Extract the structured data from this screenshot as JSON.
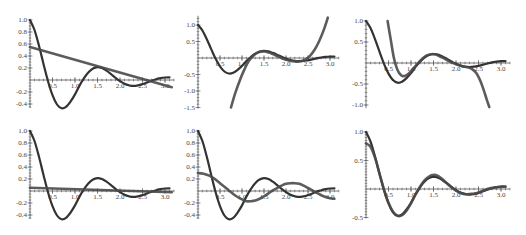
{
  "chart_data": [
    {
      "type": "line",
      "panel": 1,
      "frame": {
        "ox": 30,
        "oy": 80,
        "sx": 45,
        "sy": 60
      },
      "xlim": [
        0,
        3.2
      ],
      "ylim": [
        -0.45,
        1.0
      ],
      "xticks": [
        {
          "v": 0.5,
          "label": "0.5"
        },
        {
          "v": 1.0,
          "label": "1.0"
        },
        {
          "v": 1.5,
          "label": "1.5"
        },
        {
          "v": 2.0,
          "label": "2.0"
        },
        {
          "v": 2.5,
          "label": "2.5"
        },
        {
          "v": 3.0,
          "label": "3.0"
        }
      ],
      "yticks": [
        {
          "v": 1.0,
          "label": "1.0"
        },
        {
          "v": 0.8,
          "label": "0.8"
        },
        {
          "v": 0.6,
          "label": "0.6"
        },
        {
          "v": 0.4,
          "label": "0.4"
        },
        {
          "v": 0.2,
          "label": "0.2"
        },
        {
          "v": -0.2,
          "label": "-0.2"
        },
        {
          "v": -0.4,
          "label": "-0.4"
        }
      ],
      "series": [
        {
          "name": "f",
          "role": "curve",
          "x_start": 0,
          "x_step": 0.1,
          "values": [
            1.0,
            0.833,
            0.57,
            0.269,
            -0.02,
            -0.252,
            -0.408,
            -0.47,
            -0.448,
            -0.36,
            -0.24,
            -0.093,
            0.03,
            0.129,
            0.192,
            0.215,
            0.199,
            0.155,
            0.098,
            0.036,
            -0.02,
            -0.062,
            -0.088,
            -0.098,
            -0.089,
            -0.069,
            -0.041,
            -0.012,
            0.014,
            0.032,
            0.042,
            0.044
          ]
        },
        {
          "name": "approx",
          "role": "approx",
          "x": [
            0,
            3.15
          ],
          "values": [
            0.55,
            -0.12
          ]
        }
      ]
    },
    {
      "type": "line",
      "panel": 2,
      "frame": {
        "ox": 198,
        "oy": 58,
        "sx": 44,
        "sy": 33
      },
      "xlim": [
        0,
        3.2
      ],
      "ylim": [
        -1.5,
        1.25
      ],
      "xticks": [
        {
          "v": 0.5,
          "label": "0.5"
        },
        {
          "v": 1.0,
          "label": "1.0"
        },
        {
          "v": 1.5,
          "label": "1.5"
        },
        {
          "v": 2.0,
          "label": "2.0"
        },
        {
          "v": 2.5,
          "label": "2.5"
        },
        {
          "v": 3.0,
          "label": "3.0"
        }
      ],
      "yticks": [
        {
          "v": 1.0,
          "label": "1.0"
        },
        {
          "v": 0.5,
          "label": "0.5"
        },
        {
          "v": -0.5,
          "label": "-0.5"
        },
        {
          "v": -1.0,
          "label": "-1.0"
        },
        {
          "v": -1.5,
          "label": "-1.5"
        }
      ],
      "series": [
        {
          "name": "f",
          "role": "curve",
          "x_start": 0,
          "x_step": 0.1,
          "values": [
            1.0,
            0.833,
            0.57,
            0.269,
            -0.02,
            -0.252,
            -0.408,
            -0.47,
            -0.448,
            -0.36,
            -0.24,
            -0.093,
            0.03,
            0.129,
            0.192,
            0.215,
            0.199,
            0.155,
            0.098,
            0.036,
            -0.02,
            -0.062,
            -0.088,
            -0.098,
            -0.089,
            -0.069,
            -0.041,
            -0.012,
            0.014,
            0.032,
            0.042,
            0.044
          ]
        },
        {
          "name": "approx",
          "role": "approx",
          "x": [
            0.75,
            0.85,
            0.95,
            1.05,
            1.15,
            1.25,
            1.35,
            1.45,
            1.55,
            1.65,
            1.75,
            1.85,
            1.95,
            2.05,
            2.15,
            2.25,
            2.35,
            2.45,
            2.55,
            2.65,
            2.75,
            2.85,
            2.95
          ],
          "values": [
            -1.5,
            -1.05,
            -0.68,
            -0.36,
            -0.1,
            0.06,
            0.16,
            0.2,
            0.19,
            0.15,
            0.09,
            0.03,
            -0.03,
            -0.07,
            -0.1,
            -0.11,
            -0.09,
            -0.04,
            0.07,
            0.25,
            0.5,
            0.82,
            1.22
          ]
        }
      ]
    },
    {
      "type": "line",
      "panel": 3,
      "frame": {
        "ox": 366,
        "oy": 63,
        "sx": 45,
        "sy": 42
      },
      "xlim": [
        0,
        3.2
      ],
      "ylim": [
        -1.05,
        1.0
      ],
      "xticks": [
        {
          "v": 0.5,
          "label": "0.5"
        },
        {
          "v": 1.0,
          "label": "1.0"
        },
        {
          "v": 1.5,
          "label": "1.5"
        },
        {
          "v": 2.0,
          "label": "2.0"
        },
        {
          "v": 2.5,
          "label": "2.5"
        },
        {
          "v": 3.0,
          "label": "3.0"
        }
      ],
      "yticks": [
        {
          "v": 1.0,
          "label": "1.0"
        },
        {
          "v": 0.5,
          "label": "0.5"
        },
        {
          "v": -0.5,
          "label": "-0.5"
        },
        {
          "v": -1.0,
          "label": "-1.0"
        }
      ],
      "series": [
        {
          "name": "f",
          "role": "curve",
          "x_start": 0,
          "x_step": 0.1,
          "values": [
            1.0,
            0.833,
            0.57,
            0.269,
            -0.02,
            -0.252,
            -0.408,
            -0.47,
            -0.448,
            -0.36,
            -0.24,
            -0.093,
            0.03,
            0.129,
            0.192,
            0.215,
            0.199,
            0.155,
            0.098,
            0.036,
            -0.02,
            -0.062,
            -0.088,
            -0.098,
            -0.089,
            -0.069,
            -0.041,
            -0.012,
            0.014,
            0.032,
            0.042,
            0.044
          ]
        },
        {
          "name": "approx",
          "role": "approx",
          "x": [
            0.48,
            0.55,
            0.62,
            0.7,
            0.78,
            0.86,
            0.95,
            1.05,
            1.15,
            1.25,
            1.35,
            1.45,
            1.55,
            1.65,
            1.75,
            1.85,
            1.95,
            2.05,
            2.15,
            2.25,
            2.35,
            2.45,
            2.55,
            2.62,
            2.68,
            2.74
          ],
          "values": [
            1.0,
            0.55,
            0.12,
            -0.17,
            -0.29,
            -0.31,
            -0.25,
            -0.13,
            -0.01,
            0.1,
            0.18,
            0.21,
            0.2,
            0.15,
            0.1,
            0.04,
            -0.01,
            -0.05,
            -0.08,
            -0.1,
            -0.14,
            -0.24,
            -0.45,
            -0.66,
            -0.86,
            -1.05
          ]
        }
      ]
    },
    {
      "type": "line",
      "panel": 4,
      "frame": {
        "ox": 30,
        "oy": 191,
        "sx": 45,
        "sy": 60
      },
      "xlim": [
        0,
        3.2
      ],
      "ylim": [
        -0.45,
        1.0
      ],
      "xticks": [
        {
          "v": 0.5,
          "label": "0.5"
        },
        {
          "v": 1.0,
          "label": "1.0"
        },
        {
          "v": 1.5,
          "label": "1.5"
        },
        {
          "v": 2.0,
          "label": "2.0"
        },
        {
          "v": 2.5,
          "label": "2.5"
        },
        {
          "v": 3.0,
          "label": "3.0"
        }
      ],
      "yticks": [
        {
          "v": 1.0,
          "label": "1.0"
        },
        {
          "v": 0.8,
          "label": "0.8"
        },
        {
          "v": 0.6,
          "label": "0.6"
        },
        {
          "v": 0.4,
          "label": "0.4"
        },
        {
          "v": 0.2,
          "label": "0.2"
        },
        {
          "v": -0.2,
          "label": "-0.2"
        },
        {
          "v": -0.4,
          "label": "-0.4"
        }
      ],
      "series": [
        {
          "name": "f",
          "role": "curve",
          "x_start": 0,
          "x_step": 0.1,
          "values": [
            1.0,
            0.833,
            0.57,
            0.269,
            -0.02,
            -0.252,
            -0.408,
            -0.47,
            -0.448,
            -0.36,
            -0.24,
            -0.093,
            0.03,
            0.129,
            0.192,
            0.215,
            0.199,
            0.155,
            0.098,
            0.036,
            -0.02,
            -0.062,
            -0.088,
            -0.098,
            -0.089,
            -0.069,
            -0.041,
            -0.012,
            0.014,
            0.032,
            0.042,
            0.044
          ]
        },
        {
          "name": "approx",
          "role": "approx",
          "x": [
            0,
            3.15
          ],
          "values": [
            0.055,
            -0.02
          ]
        }
      ]
    },
    {
      "type": "line",
      "panel": 5,
      "frame": {
        "ox": 198,
        "oy": 191,
        "sx": 44,
        "sy": 60
      },
      "xlim": [
        0,
        3.2
      ],
      "ylim": [
        -0.45,
        1.0
      ],
      "xticks": [
        {
          "v": 0.5,
          "label": "0.5"
        },
        {
          "v": 1.0,
          "label": "1.0"
        },
        {
          "v": 1.5,
          "label": "1.5"
        },
        {
          "v": 2.0,
          "label": "2.0"
        },
        {
          "v": 2.5,
          "label": "2.5"
        },
        {
          "v": 3.0,
          "label": "3.0"
        }
      ],
      "yticks": [
        {
          "v": 1.0,
          "label": "1.0"
        },
        {
          "v": 0.8,
          "label": "0.8"
        },
        {
          "v": 0.6,
          "label": "0.6"
        },
        {
          "v": 0.4,
          "label": "0.4"
        },
        {
          "v": 0.2,
          "label": "0.2"
        },
        {
          "v": -0.2,
          "label": "-0.2"
        },
        {
          "v": -0.4,
          "label": "-0.4"
        }
      ],
      "series": [
        {
          "name": "f",
          "role": "curve",
          "x_start": 0,
          "x_step": 0.1,
          "values": [
            1.0,
            0.833,
            0.57,
            0.269,
            -0.02,
            -0.252,
            -0.408,
            -0.47,
            -0.448,
            -0.36,
            -0.24,
            -0.093,
            0.03,
            0.129,
            0.192,
            0.215,
            0.199,
            0.155,
            0.098,
            0.036,
            -0.02,
            -0.062,
            -0.088,
            -0.098,
            -0.089,
            -0.069,
            -0.041,
            -0.012,
            0.014,
            0.032,
            0.042,
            0.044
          ]
        },
        {
          "name": "approx",
          "role": "approx",
          "x_start": 0,
          "x_step": 0.1,
          "values": [
            0.3,
            0.29,
            0.27,
            0.24,
            0.19,
            0.13,
            0.07,
            0.01,
            -0.05,
            -0.1,
            -0.14,
            -0.17,
            -0.17,
            -0.16,
            -0.13,
            -0.09,
            -0.04,
            0.01,
            0.05,
            0.09,
            0.12,
            0.13,
            0.13,
            0.12,
            0.09,
            0.05,
            0.01,
            -0.03,
            -0.07,
            -0.1,
            -0.12,
            -0.13
          ]
        }
      ]
    },
    {
      "type": "line",
      "panel": 6,
      "frame": {
        "ox": 366,
        "oy": 189,
        "sx": 45,
        "sy": 57
      },
      "xlim": [
        0,
        3.2
      ],
      "ylim": [
        -0.5,
        1.0
      ],
      "xticks": [
        {
          "v": 0.5,
          "label": "0.5"
        },
        {
          "v": 1.0,
          "label": "1.0"
        },
        {
          "v": 1.5,
          "label": "1.5"
        },
        {
          "v": 2.0,
          "label": "2.0"
        },
        {
          "v": 2.5,
          "label": "2.5"
        },
        {
          "v": 3.0,
          "label": "3.0"
        }
      ],
      "yticks": [
        {
          "v": 1.0,
          "label": "1.0"
        },
        {
          "v": 0.5,
          "label": "0.5"
        },
        {
          "v": -0.5,
          "label": "-0.5"
        }
      ],
      "series": [
        {
          "name": "f",
          "role": "curve",
          "x_start": 0,
          "x_step": 0.1,
          "values": [
            1.0,
            0.833,
            0.57,
            0.269,
            -0.02,
            -0.252,
            -0.408,
            -0.47,
            -0.448,
            -0.36,
            -0.24,
            -0.093,
            0.03,
            0.129,
            0.192,
            0.215,
            0.199,
            0.155,
            0.098,
            0.036,
            -0.02,
            -0.062,
            -0.088,
            -0.098,
            -0.089,
            -0.069,
            -0.041,
            -0.012,
            0.014,
            0.032,
            0.042,
            0.044
          ]
        },
        {
          "name": "approx",
          "role": "approx",
          "x_start": 0,
          "x_step": 0.1,
          "values": [
            0.8,
            0.74,
            0.55,
            0.27,
            -0.01,
            -0.24,
            -0.4,
            -0.47,
            -0.46,
            -0.38,
            -0.25,
            -0.1,
            0.04,
            0.15,
            0.22,
            0.25,
            0.23,
            0.17,
            0.1,
            0.03,
            -0.03,
            -0.07,
            -0.09,
            -0.09,
            -0.08,
            -0.06,
            -0.03,
            0.0,
            0.02,
            0.03,
            0.04,
            0.04
          ]
        }
      ]
    }
  ]
}
